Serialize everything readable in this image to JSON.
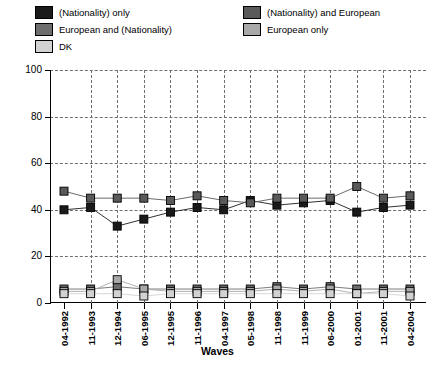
{
  "legend": {
    "items": [
      {
        "label": "(Nationality) only",
        "color": "#1a1a1a",
        "name": "legend-nationality-only"
      },
      {
        "label": "European and (Nationality)",
        "color": "#6e6e6e",
        "name": "legend-european-and-nationality"
      },
      {
        "label": "DK",
        "color": "#d2d2d2",
        "name": "legend-dk"
      },
      {
        "label": "(Nationality) and European",
        "color": "#5a5a5a",
        "name": "legend-nationality-and-european"
      },
      {
        "label": "European only",
        "color": "#a8a8a8",
        "name": "legend-european-only"
      }
    ]
  },
  "chart_data": {
    "type": "line",
    "title": "",
    "xlabel": "Waves",
    "ylabel": "Values (%)",
    "ylim": [
      0,
      100
    ],
    "yticks": [
      0,
      20,
      40,
      60,
      80,
      100
    ],
    "grid": true,
    "legend_position": "top",
    "categories": [
      "04-1992",
      "11-1993",
      "12-1994",
      "06-1995",
      "12-1995",
      "11-1996",
      "04-1997",
      "05-1998",
      "11-1998",
      "11-1999",
      "06-2000",
      "01-2001",
      "11-2001",
      "04-2004"
    ],
    "series": [
      {
        "name": "(Nationality) only",
        "color": "#1a1a1a",
        "values": [
          40,
          41,
          33,
          36,
          39,
          41,
          40,
          44,
          42,
          43,
          44,
          39,
          41,
          42
        ]
      },
      {
        "name": "(Nationality) and European",
        "color": "#5a5a5a",
        "values": [
          48,
          45,
          45,
          45,
          44,
          46,
          44,
          43,
          45,
          45,
          45,
          50,
          45,
          46
        ]
      },
      {
        "name": "European and (Nationality)",
        "color": "#6e6e6e",
        "values": [
          6,
          6,
          7,
          6,
          6,
          6,
          6,
          6,
          7,
          6,
          7,
          6,
          6,
          6
        ]
      },
      {
        "name": "European only",
        "color": "#a8a8a8",
        "values": [
          5,
          5,
          10,
          6,
          5,
          5,
          5,
          5,
          6,
          5,
          6,
          4,
          5,
          5
        ]
      },
      {
        "name": "DK",
        "color": "#d2d2d2",
        "values": [
          4,
          4,
          4,
          3,
          4,
          4,
          4,
          4,
          4,
          4,
          4,
          4,
          4,
          3
        ]
      }
    ]
  }
}
